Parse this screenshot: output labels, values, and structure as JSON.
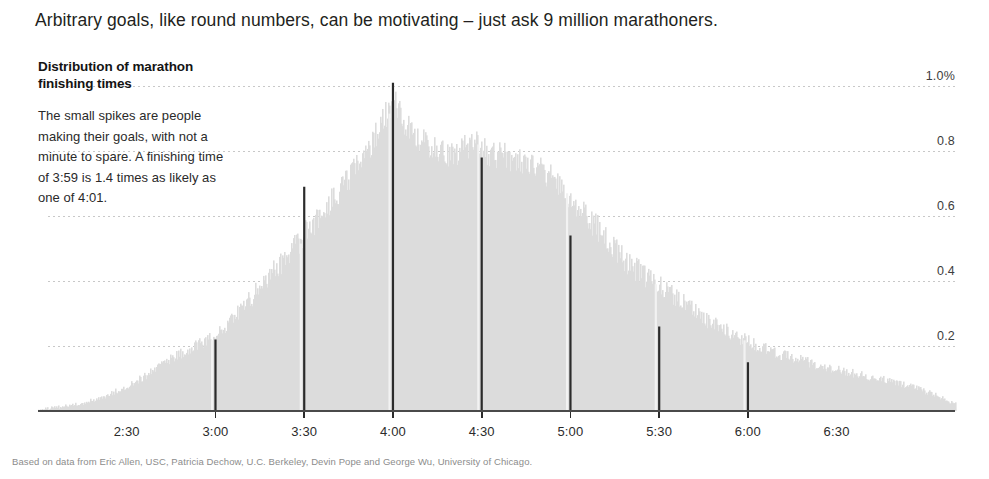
{
  "headline": "Arbitrary goals, like round numbers, can be motivating – just ask 9 million marathoners.",
  "annotation": {
    "title": "Distribution of marathon finishing times",
    "body": "The small spikes are people making their goals, with not a minute to spare. A finishing time of 3:59 is 1.4 times as likely as one of 4:01."
  },
  "source_note": "Based on data from Eric Allen, USC, Patricia Dechow, U.C. Berkeley, Devin Pope and George Wu, University of Chicago.",
  "colors": {
    "histogram_fill": "#dcdcdc",
    "spike": "#2b2b2b",
    "gridline": "#c8c8c8",
    "axis": "#4a4a4a",
    "text": "#231f20",
    "source_text": "#8c8c8c"
  },
  "chart_data": {
    "type": "bar",
    "title": "Distribution of marathon finishing times",
    "xlabel": "Finishing time",
    "ylabel": "Share of finishers",
    "grid": true,
    "legend": false,
    "ylim": [
      0,
      1.08
    ],
    "ytick_values": [
      0.2,
      0.4,
      0.6,
      0.8,
      1.0
    ],
    "ytick_labels": [
      "0.2",
      "0.4",
      "0.6",
      "0.8",
      "1.0%"
    ],
    "xlim_minutes": [
      120,
      430
    ],
    "xtick_minutes": [
      150,
      180,
      210,
      240,
      270,
      300,
      330,
      360,
      390
    ],
    "xtick_labels": [
      "2:30",
      "3:00",
      "3:30",
      "4:00",
      "4:30",
      "5:00",
      "5:30",
      "6:00",
      "6:30"
    ],
    "xticks_with_marks": [
      "3:00",
      "3:30",
      "4:00",
      "4:30",
      "5:00",
      "5:30",
      "6:00"
    ],
    "spikes": [
      {
        "label": "3:00",
        "minutes": 180,
        "value": 0.22
      },
      {
        "label": "3:30",
        "minutes": 210,
        "value": 0.69
      },
      {
        "label": "4:00",
        "minutes": 240,
        "value": 1.01
      },
      {
        "label": "4:30",
        "minutes": 270,
        "value": 0.78
      },
      {
        "label": "5:00",
        "minutes": 300,
        "value": 0.54
      },
      {
        "label": "5:30",
        "minutes": 330,
        "value": 0.26
      },
      {
        "label": "6:00",
        "minutes": 360,
        "value": 0.15
      }
    ],
    "x_minutes": [
      120,
      124,
      128,
      132,
      136,
      140,
      144,
      148,
      152,
      156,
      160,
      164,
      168,
      172,
      176,
      180,
      184,
      188,
      192,
      196,
      200,
      204,
      208,
      212,
      216,
      220,
      224,
      228,
      232,
      236,
      240,
      244,
      248,
      252,
      256,
      260,
      264,
      268,
      272,
      276,
      280,
      284,
      288,
      292,
      296,
      300,
      304,
      308,
      312,
      316,
      320,
      324,
      328,
      332,
      336,
      340,
      344,
      348,
      352,
      356,
      360,
      364,
      368,
      372,
      376,
      380,
      384,
      388,
      392,
      396,
      400,
      404,
      408,
      412,
      416,
      420,
      424,
      428
    ],
    "density_values": [
      0.005,
      0.008,
      0.012,
      0.018,
      0.026,
      0.036,
      0.05,
      0.066,
      0.085,
      0.105,
      0.13,
      0.155,
      0.175,
      0.195,
      0.21,
      0.225,
      0.26,
      0.3,
      0.345,
      0.39,
      0.43,
      0.47,
      0.515,
      0.56,
      0.605,
      0.65,
      0.7,
      0.755,
      0.81,
      0.88,
      0.95,
      0.87,
      0.83,
      0.81,
      0.79,
      0.78,
      0.8,
      0.82,
      0.79,
      0.78,
      0.77,
      0.76,
      0.74,
      0.72,
      0.69,
      0.65,
      0.61,
      0.565,
      0.52,
      0.48,
      0.445,
      0.415,
      0.39,
      0.365,
      0.34,
      0.315,
      0.29,
      0.265,
      0.245,
      0.225,
      0.21,
      0.195,
      0.18,
      0.168,
      0.157,
      0.147,
      0.138,
      0.129,
      0.121,
      0.113,
      0.105,
      0.097,
      0.089,
      0.08,
      0.07,
      0.058,
      0.044,
      0.028
    ]
  },
  "geometry": {
    "plot_left": 38,
    "plot_right": 955,
    "baseline_y": 411,
    "top_y": 60,
    "value_at_top": 1.08
  }
}
